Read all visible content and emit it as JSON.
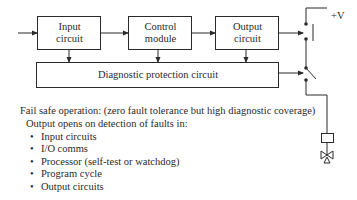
{
  "diagram": {
    "blocks": {
      "input": {
        "line1": "Input",
        "line2": "circuit"
      },
      "control": {
        "line1": "Control",
        "line2": "module"
      },
      "output": {
        "line1": "Output",
        "line2": "circuit"
      },
      "diagnostic": {
        "label": "Diagnostic protection circuit"
      }
    },
    "supply_label": "+V"
  },
  "description": {
    "heading": "Fail safe operation: (zero fault tolerance but high diagnostic coverage)",
    "subheading": "Output opens on detection of faults in:",
    "faults": [
      "Input circuits",
      "I/O comms",
      "Processor (self-test or watchdog)",
      "Program cycle",
      "Output circuits"
    ]
  }
}
